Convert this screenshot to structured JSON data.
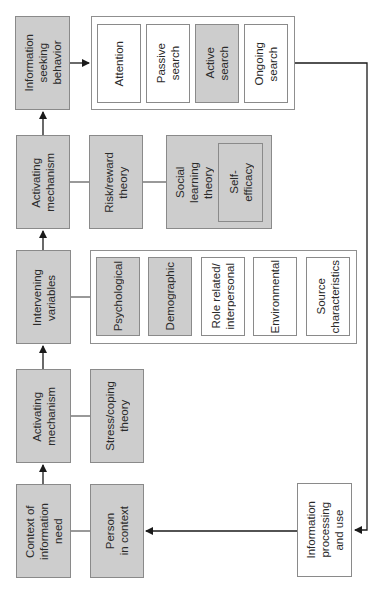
{
  "diagram": {
    "colors": {
      "shaded_fill": "#cdcdcd",
      "plain_fill": "#ffffff",
      "border": "#8a8a8a",
      "line": "#1a1a1a"
    },
    "main_chain": {
      "context_of_information_need": "Context of\ninformation\nneed",
      "activating_mechanism_1": "Activating\nmechanism",
      "intervening_variables": "Intervening\nvariables",
      "activating_mechanism_2": "Activating\nmechanism",
      "information_seeking_behavior": "Information\nseeking\nbehavior"
    },
    "person_in_context": "Person\nin context",
    "stress_coping_theory": "Stress/coping\ntheory",
    "intervening_variable_types": [
      {
        "label": "Psychological",
        "shaded": true
      },
      {
        "label": "Demographic",
        "shaded": true
      },
      {
        "label": "Role related/\ninterpersonal",
        "shaded": false
      },
      {
        "label": "Environmental",
        "shaded": false
      },
      {
        "label": "Source\ncharacteristics",
        "shaded": false
      }
    ],
    "risk_reward_theory": "Risk/reward\ntheory",
    "social_learning_theory": "Social\nlearning\ntheory",
    "self_efficacy": "Self-\nefficacy",
    "seeking_behavior_types": [
      {
        "label": "Attention",
        "shaded": false
      },
      {
        "label": "Passive\nsearch",
        "shaded": false
      },
      {
        "label": "Active\nsearch",
        "shaded": true
      },
      {
        "label": "Ongoing\nsearch",
        "shaded": false
      }
    ],
    "information_processing_and_use": "Information\nprocessing\nand use"
  }
}
